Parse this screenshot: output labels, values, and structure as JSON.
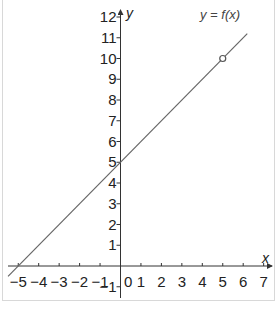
{
  "chart_data": {
    "type": "line",
    "title": "",
    "xlabel": "x",
    "ylabel": "y",
    "xlim": [
      -5,
      7
    ],
    "ylim": [
      -1,
      12
    ],
    "grid": false,
    "x_ticks": [
      -5,
      -4,
      -3,
      -2,
      -1,
      1,
      2,
      3,
      4,
      5,
      6,
      7
    ],
    "x_tick_labels": [
      "−5",
      "−4",
      "−3",
      "−2",
      "−1",
      "1",
      "2",
      "3",
      "4",
      "5",
      "6",
      "7"
    ],
    "y_ticks": [
      -1,
      1,
      2,
      3,
      4,
      5,
      6,
      7,
      8,
      9,
      10,
      11,
      12
    ],
    "y_tick_labels": [
      "−1",
      "1",
      "2",
      "3",
      "4",
      "5",
      "6",
      "7",
      "8",
      "9",
      "10",
      "11",
      "12"
    ],
    "origin_label": "0",
    "series": [
      {
        "name": "y = f(x)",
        "equation": "y = x + 5",
        "x": [
          -5.5,
          -5,
          0,
          5,
          6.2
        ],
        "y": [
          -0.5,
          0,
          5,
          10,
          11.2
        ]
      }
    ],
    "annotations": [
      {
        "type": "open-circle",
        "x": 5,
        "y": 10,
        "meaning": "point excluded from domain"
      },
      {
        "type": "label",
        "text": "y = f(x)",
        "near": [
          6,
          11.5
        ]
      }
    ]
  },
  "labels": {
    "x_axis": "x",
    "y_axis": "y",
    "origin": "0",
    "function": "y = f(x)"
  },
  "colors": {
    "axis": "#333333",
    "line": "#666666",
    "text": "#222222",
    "frame": "#d8d8d8"
  }
}
